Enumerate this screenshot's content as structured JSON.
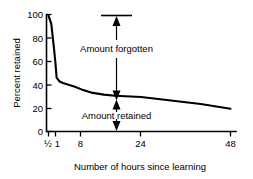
{
  "chart_data": {
    "type": "line",
    "title": "",
    "xlabel": "Number of hours since learning",
    "ylabel": "Percent retained",
    "xlim": [
      0,
      50
    ],
    "ylim": [
      0,
      100
    ],
    "grid": false,
    "legend": "none",
    "x_tick_labels": [
      "½",
      "1",
      "8",
      "24",
      "48"
    ],
    "x_tick_values": [
      0.5,
      1,
      8,
      24,
      48
    ],
    "y_tick_labels": [
      "0",
      "20",
      "40",
      "60",
      "80",
      "100"
    ],
    "y_tick_values": [
      0,
      20,
      40,
      60,
      80,
      100
    ],
    "series": [
      {
        "name": "Percent retained",
        "x": [
          0.5,
          0.7,
          0.9,
          1.0,
          1.3,
          2.0,
          3.0,
          4.5,
          6.0,
          8.0,
          11.0,
          14.0,
          17.0,
          24.0,
          32.0,
          40.0,
          48.0
        ],
        "values": [
          99,
          92,
          70,
          58,
          46,
          43,
          41.5,
          40,
          38.5,
          36,
          33,
          31.5,
          30.5,
          29.5,
          26.5,
          23.5,
          19.5
        ]
      }
    ],
    "annotations": [
      {
        "name": "amount-forgotten",
        "label": "Amount forgotten",
        "from_percent": 30,
        "to_percent": 100,
        "at_hours": 14,
        "arrow": "up",
        "cap": "top"
      },
      {
        "name": "amount-retained",
        "label": "Amount retained",
        "from_percent": 30,
        "to_percent": 0,
        "at_hours": 14,
        "arrow": "down",
        "cap": "none"
      }
    ]
  },
  "axes": {
    "y_title": "Percent retained",
    "x_title": "Number of hours since learning"
  },
  "ticks": {
    "y": [
      {
        "label": "100"
      },
      {
        "label": "80"
      },
      {
        "label": "60"
      },
      {
        "label": "40"
      },
      {
        "label": "20"
      },
      {
        "label": "0"
      }
    ],
    "x": [
      {
        "label": "½"
      },
      {
        "label": "1"
      },
      {
        "label": "8"
      },
      {
        "label": "24"
      },
      {
        "label": "48"
      }
    ]
  },
  "annotations": {
    "forgotten_label": "Amount forgotten",
    "retained_label": "Amount retained"
  },
  "colors": {
    "ink": "#000000",
    "background": "#ffffff"
  }
}
